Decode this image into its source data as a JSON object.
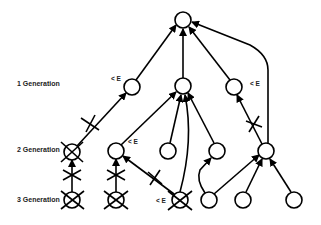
{
  "generation_labels": {
    "gen1": "1 Generation",
    "gen2": "2 Generation",
    "gen3": "3 Generation"
  },
  "energy_label": "< E",
  "nodes": [
    {
      "id": "root",
      "generation": 0,
      "eliminated": false
    },
    {
      "id": "g1a",
      "generation": 1,
      "eliminated": false,
      "tag": "< E"
    },
    {
      "id": "g1b",
      "generation": 1,
      "eliminated": false
    },
    {
      "id": "g1c",
      "generation": 1,
      "eliminated": false,
      "tag": "< E"
    },
    {
      "id": "g2a",
      "generation": 2,
      "eliminated": true
    },
    {
      "id": "g2b",
      "generation": 2,
      "eliminated": false,
      "tag": "< E"
    },
    {
      "id": "g2c",
      "generation": 2,
      "eliminated": false
    },
    {
      "id": "g2d",
      "generation": 2,
      "eliminated": false
    },
    {
      "id": "g2e",
      "generation": 2,
      "eliminated": false
    },
    {
      "id": "g3a",
      "generation": 3,
      "eliminated": true
    },
    {
      "id": "g3b",
      "generation": 3,
      "eliminated": true
    },
    {
      "id": "g3c",
      "generation": 3,
      "eliminated": true,
      "tag": "< E"
    },
    {
      "id": "g3d",
      "generation": 3,
      "eliminated": false
    },
    {
      "id": "g3e",
      "generation": 3,
      "eliminated": false
    },
    {
      "id": "g3f",
      "generation": 3,
      "eliminated": false
    }
  ],
  "colors": {
    "stroke": "#000000",
    "text": "#222222",
    "background": "#ffffff"
  }
}
